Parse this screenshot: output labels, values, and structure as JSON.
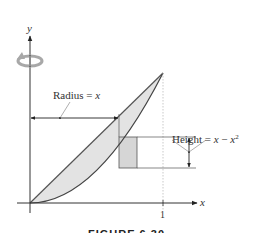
{
  "axes": {
    "x_label": "x",
    "y_label": "y",
    "x_tick": "1"
  },
  "annotations": {
    "radius_label": "Radius = ",
    "radius_var": "x",
    "height_label": "Height = ",
    "height_expr_x": "x",
    "height_minus": " − ",
    "height_expr_x2": "x",
    "height_exp": "2"
  },
  "curves": {
    "upper": "y = x",
    "lower": "y = x^2",
    "region_fill": "#e3e3e3",
    "stroke": "#555555"
  },
  "rotation_icon": {
    "name": "rotation-arrow-icon",
    "color": "#aaaaaa"
  },
  "caption": "FIGURE 6.30"
}
